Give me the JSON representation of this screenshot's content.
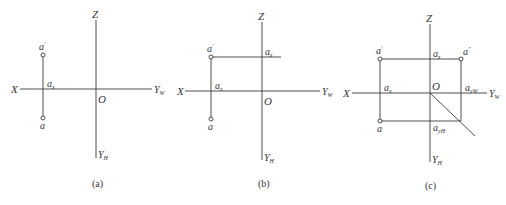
{
  "figure": {
    "panels": [
      {
        "caption": "(a)",
        "axes": {
          "x": "X",
          "z": "Z",
          "origin": "O",
          "yw": "Y",
          "yw_sub": "W",
          "yh": "Y",
          "yh_sub": "H"
        },
        "points": {
          "a_prime": "a",
          "a_prime_mark": "'",
          "ax": "a",
          "ax_sub": "x",
          "a": "a"
        }
      },
      {
        "caption": "(b)",
        "axes": {
          "x": "X",
          "z": "Z",
          "origin": "O",
          "yw": "Y",
          "yw_sub": "W",
          "yh": "Y",
          "yh_sub": "H"
        },
        "points": {
          "a_prime": "a",
          "a_prime_mark": "'",
          "ax": "a",
          "ax_sub": "x",
          "az": "a",
          "az_sub": "z",
          "a": "a"
        }
      },
      {
        "caption": "(c)",
        "axes": {
          "x": "X",
          "z": "Z",
          "origin": "O",
          "yw": "Y",
          "yw_sub": "W",
          "yh": "Y",
          "yh_sub": "H"
        },
        "points": {
          "a_prime": "a",
          "a_prime_mark": "'",
          "a_dprime": "a",
          "a_dprime_mark": "''",
          "ax": "a",
          "ax_sub": "x",
          "az": "a",
          "az_sub": "z",
          "ayw": "a",
          "ayw_sub": "yW",
          "ayh": "a",
          "ayh_sub": "yH",
          "a": "a"
        }
      }
    ]
  }
}
